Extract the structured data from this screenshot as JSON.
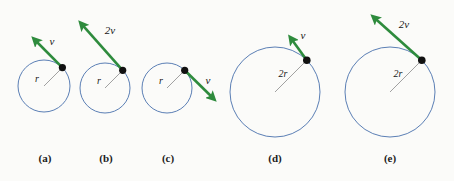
{
  "figure": {
    "background_color": "#fbfbf9",
    "circle_color": "#5b7fb5",
    "arrow_color": "#2e8b3d",
    "dot_color": "#111111",
    "radius_line_color": "#8a8a8a",
    "panels": [
      {
        "caption": "(a)",
        "caption_x": 45,
        "caption_y": 152,
        "circle": {
          "cx": 44,
          "cy": 86,
          "r": 26
        },
        "radius_label": {
          "text": "r",
          "x": 37,
          "y": 78
        },
        "radius_line": {
          "x1": 44,
          "y1": 86,
          "x2": 62.4,
          "y2": 67.6
        },
        "dot": {
          "cx": 62.4,
          "cy": 67.6,
          "r": 3.6
        },
        "arrow": {
          "x1": 62.4,
          "y1": 67.6,
          "x2": 30,
          "y2": 35
        },
        "vector_label": {
          "text": "v",
          "x": 52,
          "y": 41
        }
      },
      {
        "caption": "(b)",
        "caption_x": 106,
        "caption_y": 152,
        "circle": {
          "cx": 105,
          "cy": 88,
          "r": 25
        },
        "radius_label": {
          "text": "r",
          "x": 99,
          "y": 80
        },
        "radius_line": {
          "x1": 105,
          "y1": 88,
          "x2": 122.7,
          "y2": 70.3
        },
        "dot": {
          "cx": 122.7,
          "cy": 70.3,
          "r": 3.6
        },
        "arrow": {
          "x1": 122.7,
          "y1": 70.3,
          "x2": 77,
          "y2": 19
        },
        "vector_label": {
          "text": "2v",
          "x": 110,
          "y": 30
        }
      },
      {
        "caption": "(c)",
        "caption_x": 168,
        "caption_y": 152,
        "circle": {
          "cx": 167,
          "cy": 88,
          "r": 25
        },
        "radius_label": {
          "text": "r",
          "x": 161,
          "y": 80
        },
        "radius_line": {
          "x1": 167,
          "y1": 88,
          "x2": 184.7,
          "y2": 70.3
        },
        "dot": {
          "cx": 184.7,
          "cy": 70.3,
          "r": 3.6
        },
        "arrow": {
          "x1": 184.7,
          "y1": 70.3,
          "x2": 218,
          "y2": 103
        },
        "vector_label": {
          "text": "v",
          "x": 208,
          "y": 80
        }
      },
      {
        "caption": "(d)",
        "caption_x": 275,
        "caption_y": 152,
        "circle": {
          "cx": 275,
          "cy": 92,
          "r": 45
        },
        "radius_label": {
          "text": "2r",
          "x": 283,
          "y": 73
        },
        "radius_line": {
          "x1": 275,
          "y1": 92,
          "x2": 306.8,
          "y2": 60.2
        },
        "dot": {
          "cx": 306.8,
          "cy": 60.2,
          "r": 3.8
        },
        "arrow": {
          "x1": 306.8,
          "y1": 60.2,
          "x2": 287,
          "y2": 33
        },
        "vector_label": {
          "text": "v",
          "x": 303,
          "y": 35
        }
      },
      {
        "caption": "(e)",
        "caption_x": 390,
        "caption_y": 152,
        "circle": {
          "cx": 390,
          "cy": 92,
          "r": 45
        },
        "radius_label": {
          "text": "2r",
          "x": 398,
          "y": 73
        },
        "radius_line": {
          "x1": 390,
          "y1": 92,
          "x2": 421.8,
          "y2": 60.2
        },
        "dot": {
          "cx": 421.8,
          "cy": 60.2,
          "r": 3.8
        },
        "arrow": {
          "x1": 421.8,
          "y1": 60.2,
          "x2": 369,
          "y2": 13
        },
        "vector_label": {
          "text": "2v",
          "x": 404,
          "y": 24
        }
      }
    ]
  }
}
